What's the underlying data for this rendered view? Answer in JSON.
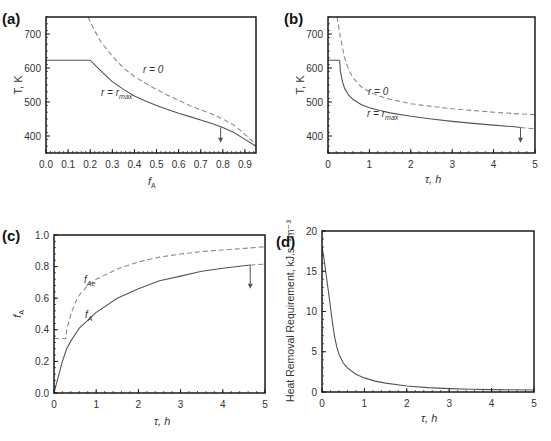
{
  "chart_data": [
    {
      "panel": "(a)",
      "type": "line",
      "xlabel": "f_A",
      "ylabel": "T, K",
      "xlim": [
        0.0,
        0.95
      ],
      "ylim": [
        350,
        750
      ],
      "xticks": [
        "0.0",
        "0.1",
        "0.2",
        "0.3",
        "0.4",
        "0.5",
        "0.6",
        "0.7",
        "0.8",
        "0.9"
      ],
      "yticks": [
        "400",
        "500",
        "600",
        "700"
      ],
      "grid": false,
      "series": [
        {
          "name": "r = 0",
          "style": "dashed",
          "x": [
            0.19,
            0.22,
            0.25,
            0.3,
            0.35,
            0.4,
            0.45,
            0.5,
            0.55,
            0.6,
            0.65,
            0.7,
            0.75,
            0.8,
            0.85,
            0.9,
            0.95
          ],
          "y": [
            750,
            710,
            675,
            635,
            600,
            575,
            555,
            537,
            520,
            505,
            490,
            477,
            465,
            450,
            432,
            405,
            375
          ]
        },
        {
          "name": "r = r_max",
          "style": "solid",
          "x": [
            0.0,
            0.2,
            0.22,
            0.25,
            0.3,
            0.35,
            0.4,
            0.45,
            0.5,
            0.55,
            0.6,
            0.65,
            0.7,
            0.75,
            0.8,
            0.85,
            0.9,
            0.95
          ],
          "y": [
            623,
            623,
            610,
            590,
            560,
            537,
            518,
            503,
            490,
            478,
            467,
            457,
            447,
            437,
            425,
            410,
            390,
            370
          ]
        }
      ],
      "annotations": [
        {
          "text": "r = 0",
          "x": 0.45,
          "y": 580
        },
        {
          "text": "r = r_max",
          "x": 0.25,
          "y": 530
        },
        {
          "text": "arrow-down",
          "x": 0.79,
          "y_from": 425,
          "y_to": 380
        }
      ]
    },
    {
      "panel": "(b)",
      "type": "line",
      "xlabel": "τ, h",
      "ylabel": "T, K",
      "xlim": [
        0,
        5
      ],
      "ylim": [
        350,
        750
      ],
      "xticks": [
        "0",
        "1",
        "2",
        "3",
        "4",
        "5"
      ],
      "yticks": [
        "400",
        "500",
        "600",
        "700"
      ],
      "grid": false,
      "series": [
        {
          "name": "r = 0",
          "style": "dashed",
          "x": [
            0.22,
            0.3,
            0.4,
            0.5,
            0.6,
            0.8,
            1.0,
            1.25,
            1.5,
            2.0,
            2.5,
            3.0,
            3.5,
            4.0,
            4.5,
            5.0
          ],
          "y": [
            750,
            690,
            630,
            595,
            572,
            545,
            530,
            517,
            508,
            495,
            487,
            480,
            475,
            470,
            466,
            463
          ]
        },
        {
          "name": "r = r_max",
          "style": "solid",
          "x": [
            0.0,
            0.28,
            0.3,
            0.35,
            0.4,
            0.5,
            0.6,
            0.8,
            1.0,
            1.25,
            1.5,
            2.0,
            2.5,
            3.0,
            3.5,
            4.0,
            4.5,
            4.65
          ],
          "y": [
            623,
            623,
            590,
            560,
            540,
            520,
            508,
            493,
            483,
            475,
            468,
            458,
            450,
            443,
            437,
            432,
            427,
            425
          ]
        },
        {
          "name": "r = 0 (tail)",
          "style": "dashed",
          "x": [
            4.65,
            5.0
          ],
          "y": [
            425,
            421
          ]
        }
      ],
      "annotations": [
        {
          "text": "r = 0",
          "x": 0.95,
          "y": 535
        },
        {
          "text": "r = r_max",
          "x": 0.95,
          "y": 485
        },
        {
          "text": "arrow-down",
          "x": 4.65,
          "y_from": 425,
          "y_to": 380
        }
      ]
    },
    {
      "panel": "(c)",
      "type": "line",
      "xlabel": "τ, h",
      "ylabel": "f_A",
      "xlim": [
        0,
        5
      ],
      "ylim": [
        0,
        1.0
      ],
      "xticks": [
        "0",
        "1",
        "2",
        "3",
        "4",
        "5"
      ],
      "yticks": [
        "0.0",
        "0.2",
        "0.4",
        "0.6",
        "0.8",
        "1.0"
      ],
      "grid": false,
      "series": [
        {
          "name": "f_Ae",
          "style": "dashed",
          "x": [
            0.0,
            0.28,
            0.3,
            0.4,
            0.5,
            0.6,
            0.8,
            1.0,
            1.5,
            2.0,
            2.5,
            3.0,
            3.5,
            4.0,
            4.5,
            5.0
          ],
          "y": [
            0.345,
            0.345,
            0.4,
            0.5,
            0.57,
            0.62,
            0.68,
            0.72,
            0.785,
            0.83,
            0.86,
            0.88,
            0.895,
            0.905,
            0.915,
            0.925
          ]
        },
        {
          "name": "f_A",
          "style": "solid",
          "x": [
            0.0,
            0.1,
            0.2,
            0.3,
            0.4,
            0.5,
            0.6,
            0.8,
            1.0,
            1.5,
            2.0,
            2.5,
            3.0,
            3.5,
            4.0,
            4.5,
            4.65
          ],
          "y": [
            0.0,
            0.1,
            0.2,
            0.28,
            0.33,
            0.37,
            0.41,
            0.46,
            0.51,
            0.6,
            0.66,
            0.71,
            0.74,
            0.77,
            0.79,
            0.805,
            0.81
          ]
        },
        {
          "name": "f_Ae (tail)",
          "style": "dashed",
          "x": [
            4.65,
            5.0
          ],
          "y": [
            0.81,
            0.815
          ]
        }
      ],
      "annotations": [
        {
          "text": "f_Ae",
          "x": 0.75,
          "y": 0.7
        },
        {
          "text": "f_A",
          "x": 0.75,
          "y": 0.48
        },
        {
          "text": "arrow-down",
          "x": 4.65,
          "y_from": 0.81,
          "y_to": 0.66
        }
      ]
    },
    {
      "panel": "(d)",
      "type": "line",
      "xlabel": "τ, h",
      "ylabel": "Heat Removal Requirement, kJ.s⁻¹m⁻³",
      "xlim": [
        0,
        5
      ],
      "ylim": [
        0,
        20
      ],
      "xticks": [
        "0",
        "1",
        "2",
        "3",
        "4",
        "5"
      ],
      "yticks": [
        "0",
        "5",
        "10",
        "15",
        "20"
      ],
      "grid": false,
      "series": [
        {
          "name": "heat removal",
          "style": "solid",
          "x": [
            0.0,
            0.05,
            0.1,
            0.15,
            0.2,
            0.25,
            0.3,
            0.35,
            0.4,
            0.5,
            0.6,
            0.8,
            1.0,
            1.25,
            1.5,
            2.0,
            2.5,
            3.0,
            3.5,
            4.0,
            4.5,
            5.0
          ],
          "y": [
            18.0,
            16.5,
            14.5,
            12.5,
            10.5,
            8.5,
            6.8,
            5.6,
            4.7,
            3.6,
            3.0,
            2.2,
            1.75,
            1.35,
            1.1,
            0.75,
            0.55,
            0.42,
            0.35,
            0.3,
            0.27,
            0.25
          ]
        }
      ],
      "annotations": []
    }
  ],
  "panels": {
    "a": {
      "tag": "(a)",
      "xlabel_main": "f",
      "xlabel_sub": "A",
      "ylabel": "T, K",
      "xticks": [
        "0.0",
        "0.1",
        "0.2",
        "0.3",
        "0.4",
        "0.5",
        "0.6",
        "0.7",
        "0.8",
        "0.9"
      ],
      "yticks": [
        "400",
        "500",
        "600",
        "700"
      ],
      "anno1_main": "r = 0",
      "anno2_main": "r = r",
      "anno2_sub": "max"
    },
    "b": {
      "tag": "(b)",
      "xlabel": "τ, h",
      "ylabel": "T, K",
      "xticks": [
        "0",
        "1",
        "2",
        "3",
        "4",
        "5"
      ],
      "yticks": [
        "400",
        "500",
        "600",
        "700"
      ],
      "anno1_main": "r = 0",
      "anno2_main": "r = r",
      "anno2_sub": "max"
    },
    "c": {
      "tag": "(c)",
      "xlabel": "τ, h",
      "ylabel_main": "f",
      "ylabel_sub": "A",
      "xticks": [
        "0",
        "1",
        "2",
        "3",
        "4",
        "5"
      ],
      "yticks": [
        "0.0",
        "0.2",
        "0.4",
        "0.6",
        "0.8",
        "1.0"
      ],
      "anno1_main": "f",
      "anno1_sub": "Ae",
      "anno2_main": "f",
      "anno2_sub": "A"
    },
    "d": {
      "tag": "(d)",
      "xlabel": "τ, h",
      "ylabel": "Heat Removal Requirement, kJ.s⁻¹m⁻³",
      "xticks": [
        "0",
        "1",
        "2",
        "3",
        "4",
        "5"
      ],
      "yticks": [
        "0",
        "5",
        "10",
        "15",
        "20"
      ]
    }
  },
  "colors": {
    "axis": "#1a1a1a",
    "solid_line": "#555555",
    "dashed_line": "#8a8a8a",
    "arrow": "#555555"
  }
}
